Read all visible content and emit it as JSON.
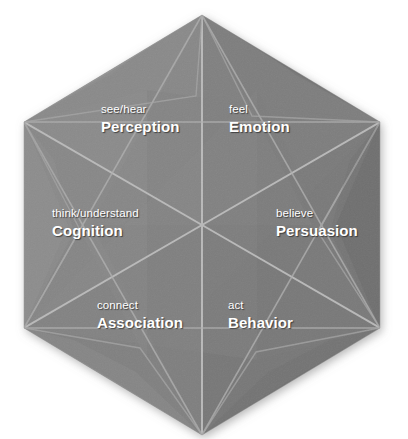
{
  "diagram": {
    "shape": "hexagon",
    "background_color": "#ffffff",
    "face_color": "#828282",
    "face_color_light": "#929292",
    "face_color_dark": "#6f6f6f",
    "face_color_darker": "#636363",
    "crease_color": "#b4b4b4",
    "label_color": "#ffffff",
    "segments": [
      {
        "id": "perception",
        "verb": "see/hear",
        "noun": "Perception"
      },
      {
        "id": "emotion",
        "verb": "feel",
        "noun": "Emotion"
      },
      {
        "id": "cognition",
        "verb": "think/understand",
        "noun": "Cognition"
      },
      {
        "id": "persuasion",
        "verb": "believe",
        "noun": "Persuasion"
      },
      {
        "id": "association",
        "verb": "connect",
        "noun": "Association"
      },
      {
        "id": "behavior",
        "verb": "act",
        "noun": "Behavior"
      }
    ]
  }
}
